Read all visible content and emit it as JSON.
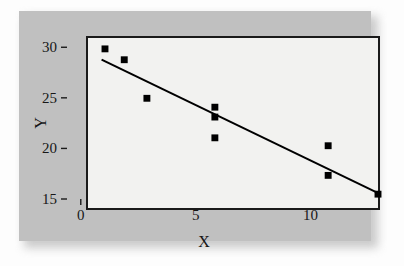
{
  "figure": {
    "background_color": "#c0c0c0",
    "plot_background_color": "#f2f2f0",
    "frame_color": "#1a1a1a",
    "marker_color": "#000000",
    "line_color": "#000000"
  },
  "axes": {
    "x_title": "X",
    "y_title": "Y",
    "x_major_ticks": [
      0,
      5,
      10
    ],
    "x_major_labels": [
      "0",
      "5",
      "10"
    ],
    "x_minor_ticks": [
      1,
      2,
      3,
      4,
      6,
      7,
      8,
      9,
      11,
      12
    ],
    "y_major_ticks": [
      15,
      20,
      25,
      30
    ],
    "y_major_labels": [
      "15",
      "20",
      "25",
      "30"
    ]
  },
  "chart_data": {
    "type": "scatter",
    "title": "",
    "subtitle": "",
    "xlabel": "X",
    "ylabel": "Y",
    "xlim": [
      -0.6,
      12.2
    ],
    "ylim": [
      15,
      32.2
    ],
    "grid": false,
    "legend": null,
    "x_ticks": [
      0,
      5,
      10
    ],
    "x_tick_labels": [
      "0",
      "5",
      "10"
    ],
    "y_ticks": [
      15,
      20,
      25,
      30
    ],
    "y_tick_labels": [
      "15",
      "20",
      "25",
      "30"
    ],
    "series": [
      {
        "name": "observations",
        "type": "scatter",
        "marker": "square",
        "marker_size": 7,
        "color": "#000000",
        "points": [
          {
            "x": 0.15,
            "y": 31.1
          },
          {
            "x": 1.0,
            "y": 30.0
          },
          {
            "x": 2.0,
            "y": 26.1
          },
          {
            "x": 5.0,
            "y": 25.2
          },
          {
            "x": 5.0,
            "y": 24.2
          },
          {
            "x": 5.0,
            "y": 22.1
          },
          {
            "x": 10.0,
            "y": 21.3
          },
          {
            "x": 10.0,
            "y": 18.3
          },
          {
            "x": 12.2,
            "y": 16.4
          }
        ]
      },
      {
        "name": "regression-line",
        "type": "line",
        "color": "#000000",
        "width": 2,
        "endpoints": [
          {
            "x": 0.0,
            "y": 30.0
          },
          {
            "x": 12.3,
            "y": 16.4
          }
        ],
        "slope": -1.106,
        "intercept": 30.0
      }
    ]
  }
}
